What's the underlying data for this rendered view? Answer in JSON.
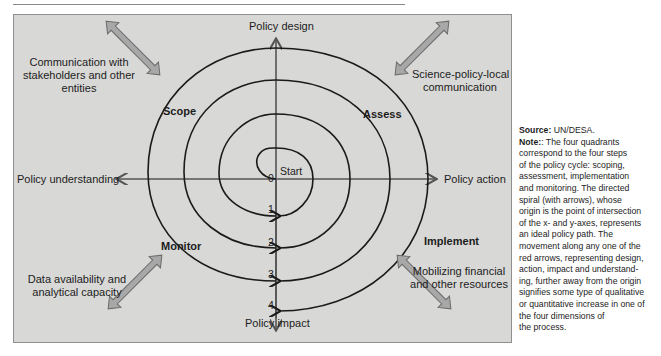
{
  "header": {
    "title_fragment": "g p"
  },
  "diagram": {
    "axes": {
      "up": "Policy design",
      "right": "Policy action",
      "down": "Policy impact",
      "left": "Policy understanding"
    },
    "quadrants": {
      "top_left": "Scope",
      "top_right": "Assess",
      "bottom_right": "Implement",
      "bottom_left": "Monitor"
    },
    "start_label": "Start",
    "axis_marks": [
      "0",
      "1",
      "2",
      "3",
      "4"
    ],
    "corner_notes": {
      "top_left": [
        "Communication with",
        "stakeholders and other",
        "entities"
      ],
      "top_right": [
        "Science-policy-local",
        "communication"
      ],
      "bottom_left": [
        "Data availability and",
        "analytical capacity"
      ],
      "bottom_right": [
        "Mobilizing financial",
        "and other resources"
      ]
    },
    "colors": {
      "panel": "#d8d8d6",
      "spiral": "#1a1a1a",
      "axis": "#555555",
      "double_arrow_fill": "#a8a8a8",
      "double_arrow_stroke": "#6b6b6b"
    }
  },
  "sidebar": {
    "source_label": "Source:",
    "source_value": "UN/DESA.",
    "note_label": "Note:",
    "note_lines": [
      ": The four quadrants",
      "correspond to the four steps",
      "of the policy cycle: scoping,",
      "assessment, implementation",
      "and monitoring. The directed",
      "spiral (with arrows), whose",
      "origin is the point of intersection",
      "of the x- and y-axes,  represents",
      "an ideal policy path.  The",
      "movement along any one of the",
      "red arrows, representing design,",
      "action, impact and understand-",
      "ing, further away from the origin",
      "signifies some type of qualitative",
      "or quantitative increase in one of",
      "the four dimensions of",
      "the process."
    ]
  }
}
